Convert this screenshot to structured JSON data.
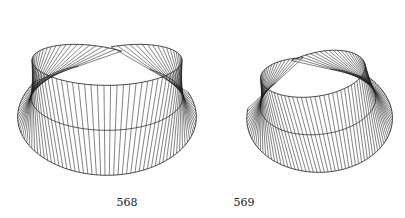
{
  "page": {
    "background": "#ffffff",
    "ink_color": "#1e1e1e"
  },
  "figures": [
    {
      "label": "568",
      "label_pos": {
        "x": 127,
        "y": 196
      },
      "description": "wireframe ruled twisted band (Mobius-like), cut open at the back",
      "geometry": {
        "cx": 107,
        "cy": 97,
        "radius_px": 76,
        "half_width_px": 47,
        "elevation_deg": 26,
        "screen_rotation_deg": 0,
        "flare": 0.16,
        "twist_start_deg": 0,
        "theta_start_deg": -158,
        "theta_end_deg": 146,
        "rulings": 74,
        "yaw_deg": 0
      }
    },
    {
      "label": "569",
      "label_pos": {
        "x": 244,
        "y": 196
      },
      "description": "wireframe ruled twisted band, rotated view, cut open at the back",
      "geometry": {
        "cx": 318,
        "cy": 102,
        "radius_px": 58,
        "half_width_px": 40,
        "elevation_deg": 34,
        "screen_rotation_deg": -6,
        "flare": 0.32,
        "twist_start_deg": 0,
        "theta_start_deg": -150,
        "theta_end_deg": 150,
        "rulings": 74,
        "yaw_deg": 14
      }
    }
  ]
}
